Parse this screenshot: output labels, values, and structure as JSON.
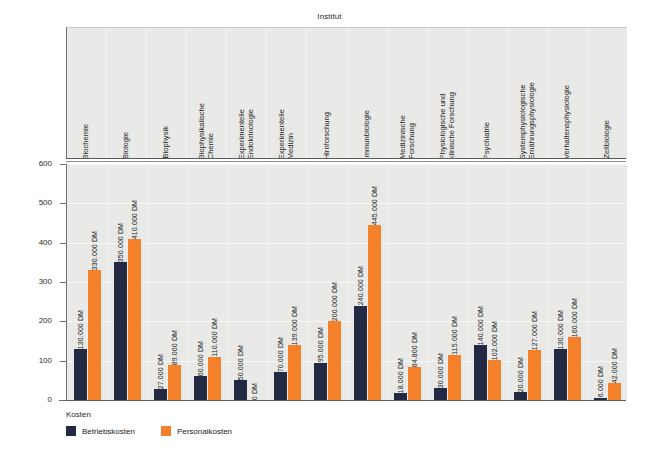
{
  "chart_data": {
    "type": "bar",
    "title": "",
    "xlabel": "Institut",
    "ylabel": "Anzahl in Tsd.",
    "ylim": [
      0,
      600
    ],
    "yticks": [
      0,
      100,
      200,
      300,
      400,
      500,
      600
    ],
    "grid": true,
    "legend_position": "bottom-left",
    "legend_title": "Kosten",
    "categories": [
      "Biochemie",
      "Biologie",
      "Biophysik",
      "Biophysikalische\nChemie",
      "Experimentelle\nEndokrinologie",
      "Experimentelle\nMedizin",
      "Hirnforschung",
      "Immunbiologie",
      "Medizinische\nForschung",
      "Physiologische und\nklinische Forschung",
      "Psychiatrie",
      "Systemphysiologische\nErnährungsphysiologie",
      "Verhaltensphysiologie",
      "Zellbiologie"
    ],
    "series": [
      {
        "name": "Betriebskosten",
        "color": "#232942",
        "values": [
          130,
          350,
          27,
          60,
          50,
          70,
          95,
          240,
          18,
          30,
          140,
          20,
          130,
          6
        ],
        "labels": [
          "130.000 DM",
          "350.000 DM",
          "27.000 DM",
          "60.000 DM",
          "50.000 DM",
          "70.000 DM",
          "95.000 DM",
          "240.000 DM",
          "18.000 DM",
          "30.000 DM",
          "140.000 DM",
          "20.000 DM",
          "130.000 DM",
          "6.000 DM"
        ]
      },
      {
        "name": "Personalkosten",
        "color": "#f5802b",
        "values": [
          330,
          410,
          89,
          110,
          0,
          139,
          200,
          445,
          84.8,
          115,
          102,
          127,
          160,
          42
        ],
        "labels": [
          "330.000 DM",
          "410.000 DM",
          "89.000 DM",
          "110.000 DM",
          "0 DM",
          "139.000 DM",
          "200.000 DM",
          "445.000 DM",
          "84.800 DM",
          "115.000 DM",
          "102.000 DM",
          "127.000 DM",
          "160.000 DM",
          "42.000 DM"
        ]
      }
    ]
  },
  "colors": {
    "betriebskosten": "#232942",
    "personalkosten": "#f5802b",
    "plot_background": "#e9e9e7",
    "axis": "#6e6e6e"
  }
}
